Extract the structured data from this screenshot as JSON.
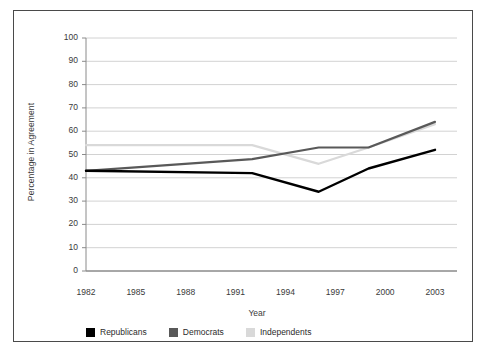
{
  "chart_data": {
    "type": "line",
    "title": "",
    "xlabel": "Year",
    "ylabel": "Percentage in Agreement",
    "xlim": [
      1982,
      2003
    ],
    "ylim": [
      0,
      100
    ],
    "yticks": [
      0,
      10,
      20,
      30,
      40,
      50,
      60,
      70,
      80,
      90,
      100
    ],
    "xticks": [
      1982,
      1985,
      1988,
      1991,
      1994,
      1997,
      2000,
      2003
    ],
    "grid": true,
    "legend_position": "bottom-left",
    "series": [
      {
        "name": "Republicans",
        "color": "#000000",
        "x": [
          1982,
          1992,
          1996,
          1999,
          2003
        ],
        "values": [
          43,
          42,
          34,
          44,
          52
        ]
      },
      {
        "name": "Democrats",
        "color": "#595959",
        "x": [
          1982,
          1992,
          1996,
          1999,
          2003
        ],
        "values": [
          43,
          48,
          53,
          53,
          64
        ]
      },
      {
        "name": "Independents",
        "color": "#d9d9d9",
        "x": [
          1982,
          1992,
          1996,
          1999,
          2003
        ],
        "values": [
          54,
          54,
          46,
          53,
          63
        ]
      }
    ]
  },
  "axis": {
    "ylabel": "Percentage in Agreement",
    "xlabel": "Year",
    "ytick_labels": [
      "0",
      "10",
      "20",
      "30",
      "40",
      "50",
      "60",
      "70",
      "80",
      "90",
      "100"
    ],
    "xtick_labels": [
      "1982",
      "1985",
      "1988",
      "1991",
      "1994",
      "1997",
      "2000",
      "2003"
    ]
  },
  "legend": {
    "items": [
      {
        "label": "Republicans",
        "color": "#000000"
      },
      {
        "label": "Democrats",
        "color": "#595959"
      },
      {
        "label": "Independents",
        "color": "#d9d9d9"
      }
    ]
  }
}
